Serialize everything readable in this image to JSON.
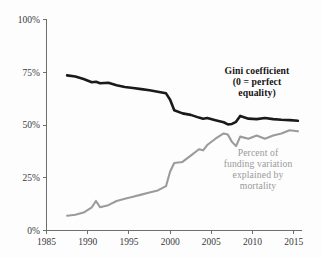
{
  "chart_data": {
    "type": "line",
    "title": "",
    "subtitle": "",
    "xlabel": "",
    "ylabel": "",
    "xlim": [
      1985,
      2016
    ],
    "ylim": [
      0,
      100
    ],
    "grid": false,
    "legend_position": "inline-annotations",
    "y_ticks": [
      "0%",
      "25%",
      "50%",
      "75%",
      "100%"
    ],
    "y_tick_values": [
      0,
      25,
      50,
      75,
      100
    ],
    "x_ticks": [
      "1985",
      "1990",
      "1995",
      "2000",
      "2005",
      "2010",
      "2015"
    ],
    "x_tick_values": [
      1985,
      1990,
      1995,
      2000,
      2005,
      2010,
      2015
    ],
    "series": [
      {
        "name": "Gini coefficient (0 = perfect equality)",
        "color": "#1a1a1a",
        "x": [
          1987.5,
          1988.5,
          1989.5,
          1990.5,
          1991,
          1991.5,
          1992.5,
          1993.5,
          1994.5,
          1995.5,
          1996.5,
          1997.5,
          1998.5,
          1999.5,
          2000,
          2000.5,
          2001.5,
          2002.5,
          2003.5,
          2004,
          2004.5,
          2005.5,
          2006.5,
          2007,
          2007.5,
          2008,
          2008.5,
          2009.5,
          2010.5,
          2011.5,
          2012.5,
          2013.5,
          2014.5,
          2015.5
        ],
        "values": [
          73.5,
          73.0,
          71.8,
          70.3,
          70.5,
          69.8,
          70.0,
          68.8,
          68.0,
          67.5,
          67.0,
          66.5,
          65.8,
          65.0,
          62.0,
          57.0,
          55.5,
          54.8,
          53.5,
          53.0,
          53.3,
          52.3,
          51.3,
          50.3,
          50.5,
          51.5,
          54.3,
          53.0,
          52.8,
          53.3,
          52.8,
          52.5,
          52.3,
          52.0
        ]
      },
      {
        "name": "Percent of funding variation explained by mortality",
        "color": "#9b9b9b",
        "x": [
          1987.5,
          1988.5,
          1989.5,
          1990.5,
          1991,
          1991.5,
          1992.5,
          1993.5,
          1994.5,
          1995.5,
          1996.5,
          1997.5,
          1998.5,
          1999.5,
          2000,
          2000.5,
          2001.5,
          2002.5,
          2003.5,
          2004,
          2004.5,
          2005.5,
          2006.5,
          2007,
          2007.5,
          2008,
          2008.5,
          2009.5,
          2010.5,
          2011.5,
          2012.5,
          2013.5,
          2014.5,
          2015.5
        ],
        "values": [
          7.0,
          7.5,
          8.5,
          11.0,
          14.0,
          11.0,
          12.0,
          14.0,
          15.0,
          16.0,
          17.0,
          18.0,
          19.0,
          21.0,
          28.0,
          32.0,
          32.5,
          35.5,
          38.5,
          38.0,
          40.5,
          43.5,
          46.0,
          45.5,
          42.0,
          40.0,
          44.5,
          43.5,
          45.0,
          43.5,
          45.0,
          46.0,
          47.5,
          47.0
        ]
      }
    ],
    "annotations": [
      {
        "id": "gini",
        "lines": [
          "Gini coefficient",
          "(0 = perfect",
          "equality)"
        ],
        "color": "#141414"
      },
      {
        "id": "mortality",
        "lines": [
          "Percent of",
          "funding variation",
          "explained by",
          "mortality"
        ],
        "color": "#9a9a9a"
      }
    ]
  }
}
